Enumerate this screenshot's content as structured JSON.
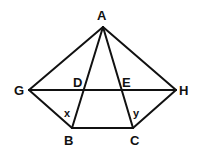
{
  "diagram": {
    "points": {
      "A": {
        "label": "A",
        "x": 103,
        "y": 27
      },
      "G": {
        "label": "G",
        "x": 29,
        "y": 90
      },
      "H": {
        "label": "H",
        "x": 176,
        "y": 90
      },
      "B": {
        "label": "B",
        "x": 72,
        "y": 128
      },
      "C": {
        "label": "C",
        "x": 133,
        "y": 128
      },
      "D": {
        "label": "D",
        "x": 83,
        "y": 90
      },
      "E": {
        "label": "E",
        "x": 123,
        "y": 90
      }
    },
    "angles": {
      "x": {
        "label": "x"
      },
      "y": {
        "label": "y"
      }
    },
    "segments": [
      "AG",
      "AH",
      "AB",
      "AC",
      "GH",
      "GB",
      "HC",
      "BC"
    ],
    "stroke_color": "#111111"
  }
}
